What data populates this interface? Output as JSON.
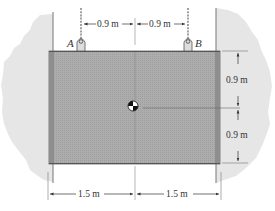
{
  "diagram": {
    "type": "engineering-statics-figure",
    "points": [
      {
        "id": "A",
        "label": "A"
      },
      {
        "id": "B",
        "label": "B"
      }
    ],
    "dimensions": {
      "top_left": "0.9 m",
      "top_right": "0.9 m",
      "right_upper": "0.9 m",
      "right_lower": "0.9 m",
      "bottom_left": "1.5 m",
      "bottom_right": "1.5 m"
    },
    "colors": {
      "plate": "#a9a9a9",
      "plate_dark": "#8e8e8e",
      "wall": "#e6e6e6",
      "wall_edge": "#888888",
      "line": "#555555",
      "cable": "#8a8a8a"
    },
    "symbols": {
      "center_of_gravity": "center-of-gravity-marker"
    }
  }
}
